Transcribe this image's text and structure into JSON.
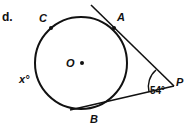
{
  "part_label": "d.",
  "points": {
    "C": "C",
    "A": "A",
    "O": "O",
    "P": "P",
    "B": "B"
  },
  "angles": {
    "P_angle": "54°",
    "arc_x": "x°"
  },
  "colors": {
    "stroke": "#111111",
    "background": "#ffffff"
  }
}
